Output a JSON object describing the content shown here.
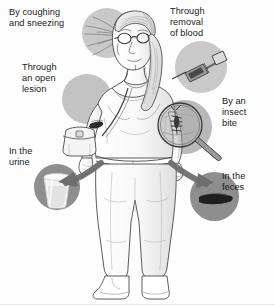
{
  "diagram": {
    "background_color": "#fdfdfd",
    "ink_color": "#4a4a4a",
    "spot_color_light": "#c9c9c9",
    "spot_color_dark": "#8e8e8e",
    "arrow_color": "#6e6e6e",
    "labels": [
      {
        "id": "coughing",
        "text": "By coughing\nand sneezing",
        "x": 9,
        "y": 7,
        "lines": 2
      },
      {
        "id": "blood-removal",
        "text": "Through\nremoval\nof blood",
        "x": 170,
        "y": 6,
        "lines": 3
      },
      {
        "id": "open-lesion",
        "text": "Through\nan open\nlesion",
        "x": 22,
        "y": 62,
        "lines": 3
      },
      {
        "id": "insect-bite",
        "text": "By an\ninsect\nbite",
        "x": 222,
        "y": 96,
        "lines": 3
      },
      {
        "id": "urine",
        "text": "In the\nurine",
        "x": 9,
        "y": 146,
        "lines": 2
      },
      {
        "id": "feces",
        "text": "In the\nfeces",
        "x": 222,
        "y": 171,
        "lines": 2
      }
    ],
    "spots": [
      {
        "id": "spot-coughing",
        "x": 82,
        "y": 8,
        "size": 50,
        "shade": "#c9c9c9"
      },
      {
        "id": "spot-blood",
        "x": 175,
        "y": 41,
        "size": 52,
        "shade": "#c9c9c9"
      },
      {
        "id": "spot-lesion",
        "x": 62,
        "y": 74,
        "size": 50,
        "shade": "#c3c3c3"
      },
      {
        "id": "spot-insect",
        "x": 158,
        "y": 100,
        "size": 54,
        "shade": "#b9b9b9"
      },
      {
        "id": "spot-urine",
        "x": 34,
        "y": 164,
        "size": 46,
        "shade": "#8e8e8e"
      },
      {
        "id": "spot-feces",
        "x": 190,
        "y": 172,
        "size": 49,
        "shade": "#8e8e8e"
      }
    ],
    "icons": [
      {
        "id": "cough-spray-icon",
        "name": "cough-spray",
        "label": "respiratory droplets spray"
      },
      {
        "id": "syringe-icon",
        "name": "syringe",
        "label": "syringe drawing blood"
      },
      {
        "id": "lesion-icon",
        "name": "open-lesion",
        "label": "open skin lesion on arm"
      },
      {
        "id": "magnifier-insect-icon",
        "name": "magnifier-insect",
        "label": "magnifying glass over biting insect"
      },
      {
        "id": "urine-cup-icon",
        "name": "urine-specimen-cup",
        "label": "specimen cup of urine"
      },
      {
        "id": "feces-icon",
        "name": "feces-specimen",
        "label": "dark stool specimen"
      }
    ],
    "arrows": [
      {
        "id": "arrow-to-urine",
        "from": "hip-left",
        "to": "spot-urine"
      },
      {
        "id": "arrow-to-feces",
        "from": "hip-right",
        "to": "spot-feces"
      }
    ]
  }
}
